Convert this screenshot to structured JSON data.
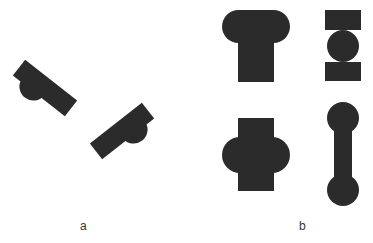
{
  "figure": {
    "panels": [
      {
        "id": "a",
        "label": "a",
        "description": "Two rotated bar shapes with semicircular bumps"
      },
      {
        "id": "b",
        "label": "b",
        "description": "Four symmetric composite shapes: T-cap, bead-between-blocks, rounded cross, dumbbell"
      }
    ],
    "shape_color": "#2b2b2b",
    "background": "#ffffff"
  }
}
